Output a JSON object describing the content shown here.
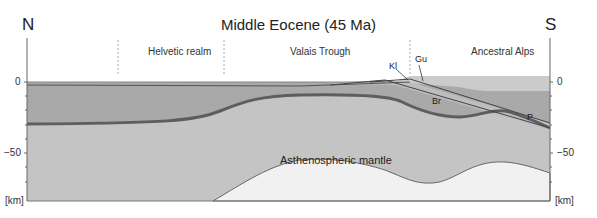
{
  "title": "Middle Eocene (45 Ma)",
  "directions": {
    "left": "N",
    "right": "S"
  },
  "realms": [
    {
      "label": "Helvetic realm"
    },
    {
      "label": "Valais Trough"
    },
    {
      "label": "Ancestral Alps"
    }
  ],
  "units": {
    "kl": "Kl",
    "gu": "Gu",
    "br": "Br",
    "p": "P"
  },
  "mantle_label": "Asthenospheric mantle",
  "axis": {
    "left_ticks": {
      "zero": "0",
      "minus50": "−50"
    },
    "right_ticks": {
      "zero": "0",
      "minus50": "−50"
    },
    "unit": "[km]",
    "range_km": [
      0,
      -85
    ],
    "tick_interval_km": 10
  },
  "colors": {
    "crust_upper": "#a9a9a9",
    "lithospheric_mantle": "#c4c4c4",
    "asthenosphere": "#f1f1f1",
    "moho_line": "#6a6a6a",
    "ancestral_alps_top": "#c9c9c9",
    "thrust_zone": "#999999"
  }
}
